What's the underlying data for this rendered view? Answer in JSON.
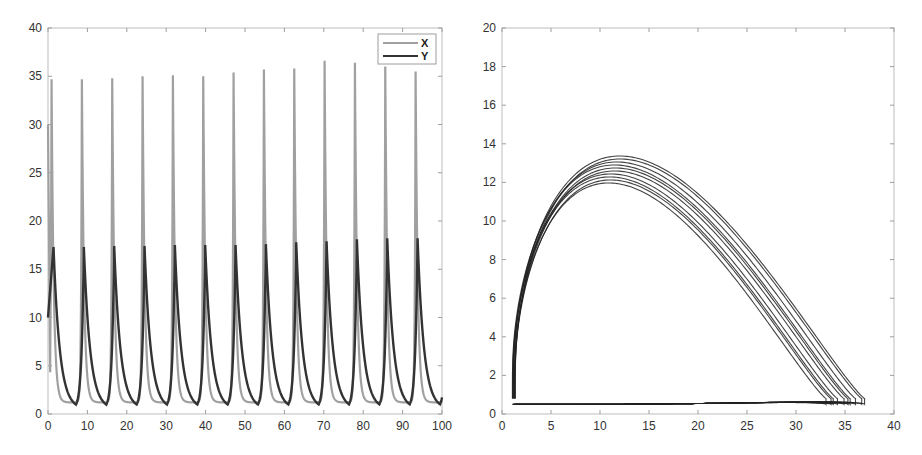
{
  "chart_data": [
    {
      "type": "line",
      "title": "",
      "xlabel": "",
      "ylabel": "",
      "xlim": [
        0,
        100
      ],
      "ylim": [
        0,
        40
      ],
      "xticks": [
        0,
        10,
        20,
        30,
        40,
        50,
        60,
        70,
        80,
        90,
        100
      ],
      "yticks": [
        0,
        5,
        10,
        15,
        20,
        25,
        30,
        35,
        40
      ],
      "grid": false,
      "legend": {
        "position": "upper right",
        "entries": [
          "X",
          "Y"
        ]
      },
      "data_provenance": "Series curves are reconstructed illustrative approximations, NOT traced from the image. Only the landmark values below were read from the screenshot.",
      "observed_landmarks": {
        "initial_values": {
          "X": 30,
          "Y": 10
        },
        "approx_period": 7.7,
        "X_peak_range": [
          34.7,
          36.6
        ],
        "Y_peak_range": [
          17.2,
          18.2
        ],
        "X_trough_approx": 1.2,
        "Y_trough_approx": 0.5
      },
      "series": [
        {
          "name": "X",
          "color": "#a0a0a0",
          "observed_peaks_approx": [
            34.7,
            34.8,
            35.0,
            35.1,
            35.0,
            35.4,
            35.7,
            35.8,
            36.6,
            36.4,
            36.0,
            35.5,
            35.6
          ],
          "curve": "reconstructed"
        },
        {
          "name": "Y",
          "color": "#333333",
          "observed_peaks_approx": [
            17.3,
            17.4,
            17.4,
            17.5,
            17.5,
            17.5,
            17.6,
            17.8,
            17.9,
            18.1,
            18.2,
            18.2,
            18.3
          ],
          "curve": "reconstructed"
        }
      ]
    },
    {
      "type": "line",
      "title": "",
      "xlabel": "",
      "ylabel": "",
      "xlim": [
        0,
        40
      ],
      "ylim": [
        0,
        20
      ],
      "xticks": [
        0,
        5,
        10,
        15,
        20,
        25,
        30,
        35,
        40
      ],
      "yticks": [
        0,
        2,
        4,
        6,
        8,
        10,
        12,
        14,
        16,
        18,
        20
      ],
      "grid": false,
      "description": "Phase portrait (X vs Y limit cycle) with multiple overlapping orbits",
      "data_provenance": "Orbit shape is a reconstructed illustrative approximation, NOT traced from the image. Only the extent values below were read from the screenshot.",
      "observed_landmarks": {
        "x_extent_approx": [
          1.2,
          37.0
        ],
        "y_extent_approx": [
          0.5,
          18.4
        ],
        "y_peak_near_x": 10
      },
      "series": [
        {
          "name": "orbit",
          "color": "#222222",
          "curve": "reconstructed"
        }
      ]
    }
  ],
  "legend": {
    "x_label": "X",
    "y_label": "Y"
  },
  "axes": {
    "left": {
      "xtick_labels": [
        "0",
        "10",
        "20",
        "30",
        "40",
        "50",
        "60",
        "70",
        "80",
        "90",
        "100"
      ],
      "ytick_labels": [
        "0",
        "5",
        "10",
        "15",
        "20",
        "25",
        "30",
        "35",
        "40"
      ]
    },
    "right": {
      "xtick_labels": [
        "0",
        "5",
        "10",
        "15",
        "20",
        "25",
        "30",
        "35",
        "40"
      ],
      "ytick_labels": [
        "0",
        "2",
        "4",
        "6",
        "8",
        "10",
        "12",
        "14",
        "16",
        "18",
        "20"
      ]
    }
  }
}
